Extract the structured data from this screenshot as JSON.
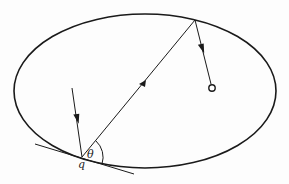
{
  "diagram": {
    "type": "ellipse-reflection",
    "labels": {
      "point": "q",
      "angle": "θ"
    },
    "colors": {
      "stroke": "#1a1a1a",
      "background": "#fdfdfd"
    },
    "elements": {
      "ellipse": {
        "cx": 145,
        "cy": 91,
        "rx": 131,
        "ry": 77
      },
      "incoming_ray": {
        "from": [
          72,
          88
        ],
        "to": [
          82,
          157
        ]
      },
      "chord": {
        "from": [
          82,
          157
        ],
        "to": [
          195,
          20
        ]
      },
      "reflected_ray": {
        "from": [
          195,
          20
        ],
        "to": [
          211,
          84
        ]
      },
      "focus_circle": {
        "cx": 212,
        "cy": 88,
        "r": 3.2
      },
      "tangent_line": {
        "from": [
          35,
          144
        ],
        "to": [
          134,
          174
        ]
      },
      "angle_arc_center": [
        82,
        157
      ]
    }
  }
}
